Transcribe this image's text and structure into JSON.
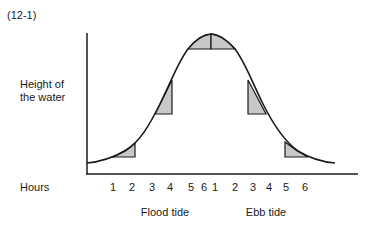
{
  "figure": {
    "label": "(12-1)",
    "y_axis_label_line1": "Height of",
    "y_axis_label_line2": "the water",
    "x_axis_label": "Hours",
    "flood_label": "Flood tide",
    "ebb_label": "Ebb tide",
    "hour_ticks": [
      "1",
      "2",
      "3",
      "4",
      "5",
      "6",
      "1",
      "2",
      "3",
      "4",
      "5",
      "6"
    ],
    "phases": [
      {
        "name": "Flood tide",
        "hours": [
          "1",
          "2",
          "3",
          "4",
          "5",
          "6"
        ]
      },
      {
        "name": "Ebb tide",
        "hours": [
          "1",
          "2",
          "3",
          "4",
          "5",
          "6"
        ]
      }
    ],
    "shaded_regions": [
      {
        "phase": "Flood tide",
        "hours": "1-2",
        "description": "small rise"
      },
      {
        "phase": "Flood tide",
        "hours": "3-4",
        "description": "large rise"
      },
      {
        "phase": "Flood tide",
        "hours": "5-6",
        "description": "small rise near high water"
      },
      {
        "phase": "Ebb tide",
        "hours": "1-2",
        "description": "small fall near high water"
      },
      {
        "phase": "Ebb tide",
        "hours": "3-4",
        "description": "large fall"
      },
      {
        "phase": "Ebb tide",
        "hours": "5-6",
        "description": "small fall"
      }
    ],
    "colors": {
      "line": "#1a1a1a",
      "shade": "#c8c8c8",
      "background": "#ffffff"
    }
  }
}
